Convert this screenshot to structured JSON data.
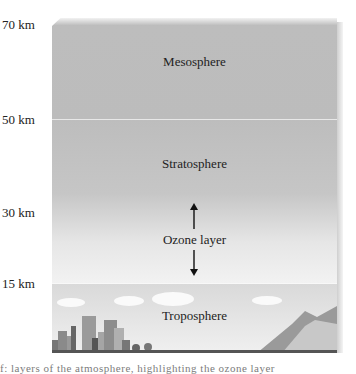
{
  "altitudes": [
    {
      "label": "70 km",
      "top": 18
    },
    {
      "label": "50 km",
      "top": 113
    },
    {
      "label": "30 km",
      "top": 206
    },
    {
      "label": "15 km",
      "top": 277
    }
  ],
  "layers": {
    "mesosphere": "Mesosphere",
    "stratosphere": "Stratosphere",
    "ozone": "Ozone layer",
    "troposphere": "Troposphere"
  },
  "caption": "f: layers of the atmosphere, highlighting the ozone layer"
}
